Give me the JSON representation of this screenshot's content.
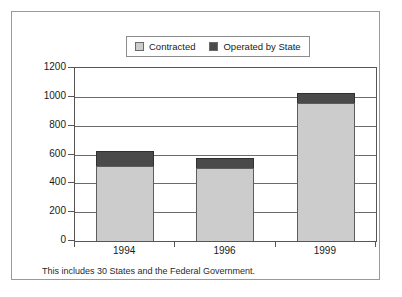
{
  "figure": {
    "footnote": "This includes 30 States and the Federal Government."
  },
  "legend": {
    "position": "top-center",
    "entries": [
      {
        "label": "Contracted",
        "color": "#cccccc",
        "swatch_name": "legend-swatch-contracted"
      },
      {
        "label": "Operated by State",
        "color": "#4a4a4a",
        "swatch_name": "legend-swatch-operated-by-state"
      }
    ]
  },
  "chart_data": {
    "type": "bar",
    "stacked": true,
    "title": "",
    "subtitle": "",
    "xlabel": "",
    "ylabel": "",
    "categories": [
      "1994",
      "1996",
      "1999"
    ],
    "series": [
      {
        "name": "Contracted",
        "color": "#cccccc",
        "values": [
          520,
          505,
          955
        ]
      },
      {
        "name": "Operated by State",
        "color": "#4a4a4a",
        "values": [
          105,
          70,
          70
        ]
      }
    ],
    "totals": [
      625,
      575,
      1025
    ],
    "ylim": [
      0,
      1200
    ],
    "yticks": [
      0,
      200,
      400,
      600,
      800,
      1000,
      1200
    ],
    "ytick_labels": [
      "0",
      "200",
      "400",
      "600",
      "800",
      "1000",
      "1200"
    ],
    "grid": true,
    "legend_position": "top-center",
    "annotations": [
      "This includes 30 States and the Federal Government."
    ]
  }
}
